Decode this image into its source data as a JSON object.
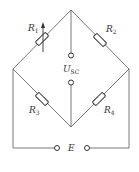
{
  "diagram": {
    "type": "wheatstone-bridge circuit",
    "resistors": [
      {
        "id": "R1",
        "label": "R",
        "sub": "1",
        "variable": true
      },
      {
        "id": "R2",
        "label": "R",
        "sub": "2",
        "variable": false
      },
      {
        "id": "R3",
        "label": "R",
        "sub": "3",
        "variable": false
      },
      {
        "id": "R4",
        "label": "R",
        "sub": "4",
        "variable": false
      }
    ],
    "output": {
      "label": "U",
      "sub": "SC"
    },
    "source": {
      "label": "E"
    },
    "colors": {
      "line": "#555555",
      "text": "#333333",
      "background": "#ffffff"
    }
  }
}
